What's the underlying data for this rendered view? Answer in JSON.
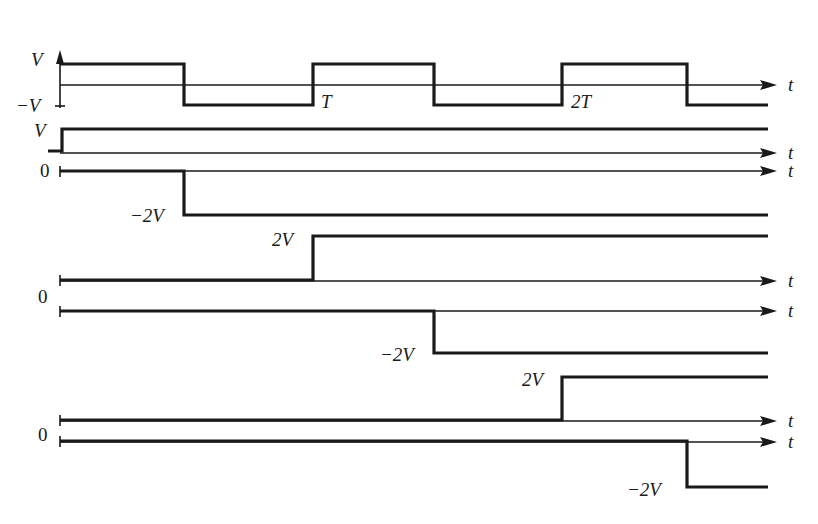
{
  "figure": {
    "time_axis_label": "t",
    "voltage_axis_label": "V"
  },
  "top_wave": {
    "label_high": "V",
    "label_low": "−V",
    "period_marks": [
      "T",
      "2T"
    ],
    "transitions_x": [
      184,
      313,
      434,
      562,
      687
    ]
  },
  "steps": [
    {
      "name": "step-0",
      "start_label": "",
      "level_label": "V",
      "step_time": "0",
      "direction": "up"
    },
    {
      "name": "step-1",
      "start_label": "0",
      "level_label": "−2V",
      "step_time": "T/2",
      "direction": "down"
    },
    {
      "name": "step-2",
      "start_label": "",
      "level_label": "2V",
      "step_time": "T",
      "direction": "up"
    },
    {
      "name": "step-3",
      "start_label": "0",
      "level_label": "−2V",
      "step_time": "3T/2",
      "direction": "down"
    },
    {
      "name": "step-4",
      "start_label": "",
      "level_label": "2V",
      "step_time": "2T",
      "direction": "up"
    },
    {
      "name": "step-5",
      "start_label": "0",
      "level_label": "−2V",
      "step_time": "5T/2",
      "direction": "down"
    }
  ],
  "labels": {
    "V_top": "V",
    "minus_V": "−V",
    "T": "T",
    "twoT": "2T",
    "V_step": "V",
    "zero_1": "0",
    "minus2V_1": "−2V",
    "twoV_1": "2V",
    "zero_2": "0",
    "minus2V_2": "−2V",
    "twoV_2": "2V",
    "zero_3": "0",
    "minus2V_3": "−2V",
    "t": "t"
  },
  "colors": {
    "ink": "#1a1a1a",
    "background": "#ffffff"
  }
}
